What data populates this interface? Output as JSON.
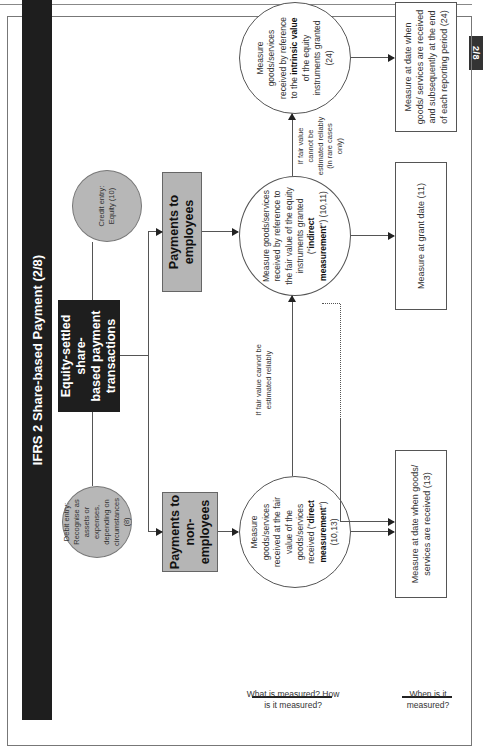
{
  "page": {
    "page_number": "2/8"
  },
  "diagram": {
    "title": "IFRS 2 Share-based Payment (2/8)",
    "debit_entry": "Debit entry: Recognise as assets or expenses, depending on circumstances (8)",
    "credit_entry": "Credit entry: Equity (10)",
    "root": {
      "line1": "Equity-settled share-",
      "line2": "based payment",
      "line3": "transactions"
    },
    "branches": {
      "non_employees": {
        "line1": "Payments to",
        "line2": "non-employees"
      },
      "employees": {
        "label": "Payments to employees"
      }
    },
    "what_measured": {
      "direct": {
        "pre": "Measure goods/services received at the fair value of the goods/services received (\"",
        "bold": "direct measurement",
        "post": "\") (10,13)"
      },
      "indirect": {
        "pre": "Measure goods/services received by reference to the fair value of the equity instruments granted (\"",
        "bold": "indirect measurement",
        "post": "\") (10,11)"
      },
      "intrinsic": {
        "pre": "Measure goods/services received by reference to the ",
        "bold": "intrinsic value",
        "post": " of the equity instruments granted (24)"
      }
    },
    "conditions": {
      "direct_fallback": "If fair value cannot be estimated reliably",
      "indirect_fallback": "If fair value cannot be estimated reliably (in rare cases only)"
    },
    "when_measured": {
      "direct": "Measure at date when goods/ services are received (13)",
      "indirect": "Measure at grant date (11)",
      "intrinsic": "Measure at date when goods/ services are received and subsequently at the end of each reporting period (24)"
    },
    "row_labels": {
      "what_how": "What is measured? How is it measured?",
      "when": "When is it measured?"
    }
  }
}
